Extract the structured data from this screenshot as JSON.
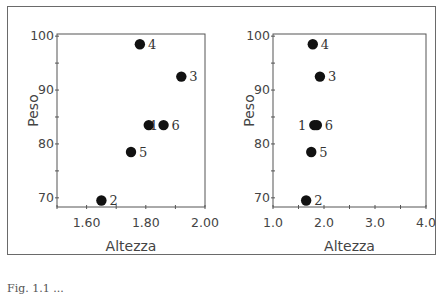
{
  "chart_data": [
    {
      "type": "scatter",
      "title": "",
      "xlabel": "Altezza",
      "ylabel": "Peso",
      "xlim": [
        1.5,
        2.0
      ],
      "ylim": [
        68.3,
        100.4
      ],
      "xticks": [
        "1.60",
        "1.80",
        "2.00"
      ],
      "yticks": [
        "70",
        "80",
        "90",
        "100"
      ],
      "points": [
        {
          "label": "1",
          "x": 1.81,
          "y": 83.5
        },
        {
          "label": "2",
          "x": 1.65,
          "y": 69.5
        },
        {
          "label": "3",
          "x": 1.92,
          "y": 92.5
        },
        {
          "label": "4",
          "x": 1.78,
          "y": 98.5
        },
        {
          "label": "5",
          "x": 1.75,
          "y": 78.5
        },
        {
          "label": "6",
          "x": 1.86,
          "y": 83.5
        }
      ],
      "grid": false
    },
    {
      "type": "scatter",
      "title": "",
      "xlabel": "Altezza",
      "ylabel": "Peso",
      "xlim": [
        1.0,
        4.0
      ],
      "ylim": [
        68.3,
        100.4
      ],
      "xticks": [
        "1.0",
        "2.0",
        "3.0",
        "4.0"
      ],
      "yticks": [
        "70",
        "80",
        "90",
        "100"
      ],
      "points": [
        {
          "label": "1",
          "x": 1.81,
          "y": 83.5
        },
        {
          "label": "2",
          "x": 1.65,
          "y": 69.5
        },
        {
          "label": "3",
          "x": 1.92,
          "y": 92.5
        },
        {
          "label": "4",
          "x": 1.78,
          "y": 98.5
        },
        {
          "label": "5",
          "x": 1.75,
          "y": 78.5
        },
        {
          "label": "6",
          "x": 1.86,
          "y": 83.5
        }
      ],
      "grid": false
    }
  ],
  "caption": "Fig. 1.1 ..."
}
